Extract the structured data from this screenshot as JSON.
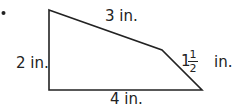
{
  "figure": {
    "type": "quadrilateral",
    "stroke_color": "#222222",
    "bullet": "•",
    "vertices": {
      "top_left": [
        49,
        10
      ],
      "bend": [
        162,
        50
      ],
      "bottom_right": [
        202,
        90
      ],
      "bottom_left": [
        49,
        90
      ]
    },
    "labels": {
      "top": "3 in.",
      "left": "2 in.",
      "bottom": "4 in.",
      "right_whole": "1",
      "right_numerator": "1",
      "right_denominator": "2",
      "right_unit": "in."
    }
  }
}
